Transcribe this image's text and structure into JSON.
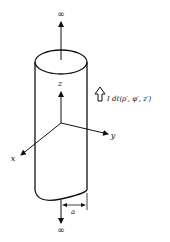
{
  "diagram": {
    "labels": {
      "top_infinity": "∞",
      "bottom_infinity": "∞",
      "z_axis": "z",
      "y_axis": "y",
      "x_axis": "x",
      "radius": "a",
      "current_element": "I dℓ(ρ′, φ′, z′)"
    },
    "colors": {
      "stroke": "#111111",
      "background": "#ffffff"
    }
  }
}
